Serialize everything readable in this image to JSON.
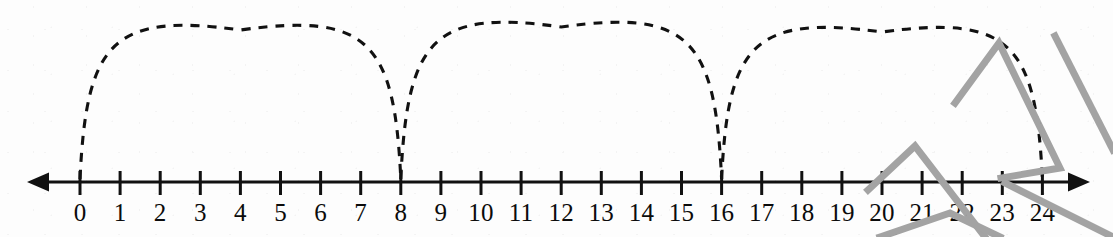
{
  "figure": {
    "width": 1113,
    "height": 237,
    "background_color": "#fdfdfd"
  },
  "number_line": {
    "axis_color": "#111111",
    "axis_y": 182,
    "left_arrow_tip_x": 27,
    "right_arrow_tip_x": 1090,
    "tick_start_x": 80,
    "tick_spacing_px": 40.1,
    "tick_top_y": 171,
    "tick_bottom_y": 195,
    "label_baseline_y": 222,
    "min": 0,
    "max": 24,
    "step": 1,
    "has_left_arrow": true,
    "has_right_arrow": true,
    "tick_labels": [
      "0",
      "1",
      "2",
      "3",
      "4",
      "5",
      "6",
      "7",
      "8",
      "9",
      "10",
      "11",
      "12",
      "13",
      "14",
      "15",
      "16",
      "17",
      "18",
      "19",
      "20",
      "21",
      "22",
      "23",
      "24"
    ]
  },
  "jumps": {
    "style": "dashed-arc",
    "color": "#111111",
    "dash_pattern": "9 8",
    "stroke_width": 3.1,
    "count": 3,
    "jump_size": 8,
    "arcs": [
      {
        "label": "jump-0-to-8",
        "from": 0,
        "to": 8,
        "apex_y": 30
      },
      {
        "label": "jump-8-to-16",
        "from": 8,
        "to": 16,
        "apex_y": 27
      },
      {
        "label": "jump-16-to-24",
        "from": 16,
        "to": 24,
        "apex_y": 32
      }
    ]
  },
  "annotations": {
    "color": "#a3a3a3",
    "stroke_width": 7,
    "description": "gray pencil caret marks over right end of number line",
    "marks": [
      {
        "name": "gray-caret-upper",
        "points": "955,103 999,43 1060,168 1001,178"
      },
      {
        "name": "gray-caret-lower",
        "points": "868,190 915,146 985,237"
      },
      {
        "name": "gray-stroke-right",
        "points": "1055,36 1113,150"
      },
      {
        "name": "gray-stroke-lower-tail",
        "points": "880,237 950,213 1000,237"
      },
      {
        "name": "gray-stroke-diagonal",
        "points": "1005,183 1113,237"
      }
    ]
  }
}
